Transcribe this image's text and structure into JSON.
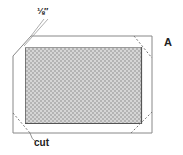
{
  "figure": {
    "label": "A"
  },
  "annotations": {
    "measurement": "⅛″",
    "cut": "cut"
  },
  "colors": {
    "outline": "#888888",
    "dashed": "#777777",
    "fill_light": "#d6d6d6",
    "fill_dark": "#b4b4b4",
    "inner_border": "#666666",
    "text": "#222222"
  }
}
